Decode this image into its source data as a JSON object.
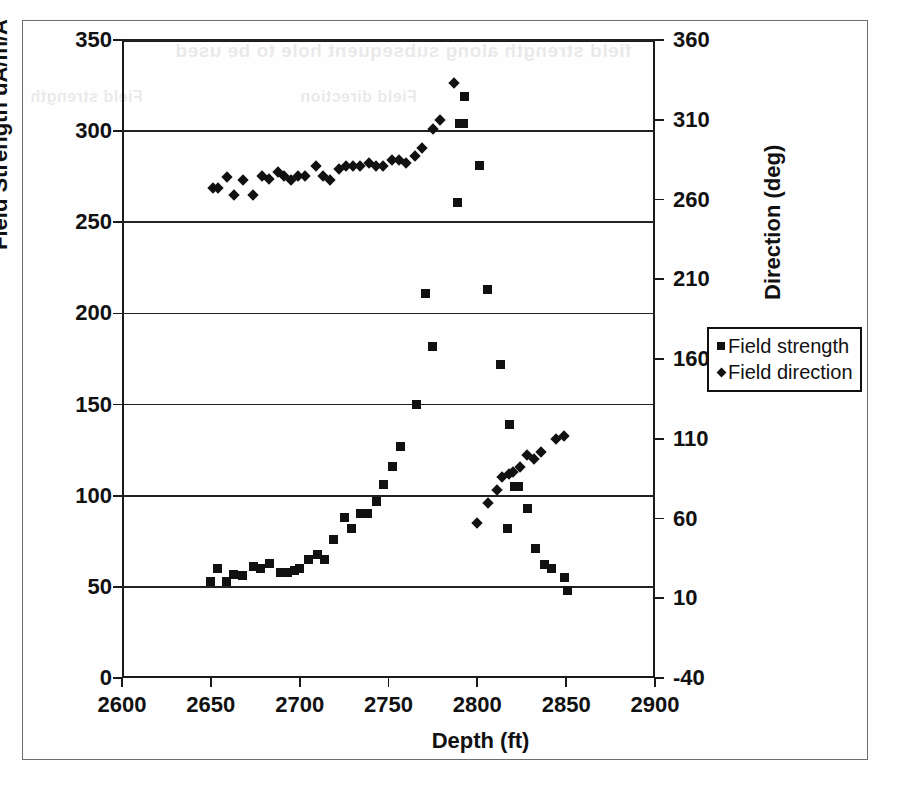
{
  "figure": {
    "frame_border_color": "#6e6e6e",
    "background": "#ffffff",
    "marker_color": "#111111",
    "ghost_text_1": "field strength along subsequent hole to be used",
    "ghost_text_2": "Field strength",
    "ghost_text_3": "Field direction"
  },
  "legend": {
    "position": "right-middle",
    "entries": [
      {
        "label": "Field strength",
        "marker": "square-marker-icon"
      },
      {
        "label": "Field direction",
        "marker": "diamond-marker-icon"
      }
    ]
  },
  "axes": {
    "left": {
      "title": "Field Strength uA/m/A",
      "ticks": [
        "0",
        "50",
        "100",
        "150",
        "200",
        "250",
        "300",
        "350"
      ]
    },
    "right": {
      "title": "Direction (deg)",
      "ticks": [
        "-40",
        "10",
        "60",
        "110",
        "160",
        "210",
        "260",
        "310",
        "360"
      ]
    },
    "bottom": {
      "title": "Depth (ft)",
      "ticks": [
        "2600",
        "2650",
        "2700",
        "2750",
        "2800",
        "2850",
        "2900"
      ]
    }
  },
  "chart_data": {
    "type": "scatter",
    "title": "",
    "xlabel": "Depth (ft)",
    "ylabel": "Field Strength uA/m/A",
    "y2label": "Direction (deg)",
    "xlim": [
      2600,
      2900
    ],
    "ylim": [
      0,
      350
    ],
    "y2lim": [
      -40,
      360
    ],
    "grid": true,
    "legend_position": "right",
    "series": [
      {
        "name": "Field strength",
        "marker": "square",
        "axis": "left",
        "units": "uA/m/A",
        "points": [
          [
            2650,
            53
          ],
          [
            2654,
            60
          ],
          [
            2659,
            53
          ],
          [
            2663,
            57
          ],
          [
            2668,
            56
          ],
          [
            2674,
            61
          ],
          [
            2678,
            60
          ],
          [
            2683,
            63
          ],
          [
            2689,
            58
          ],
          [
            2693,
            58
          ],
          [
            2697,
            59
          ],
          [
            2700,
            60
          ],
          [
            2705,
            65
          ],
          [
            2710,
            68
          ],
          [
            2714,
            65
          ],
          [
            2719,
            76
          ],
          [
            2725,
            88
          ],
          [
            2729,
            82
          ],
          [
            2734,
            90
          ],
          [
            2738,
            90
          ],
          [
            2743,
            97
          ],
          [
            2747,
            106
          ],
          [
            2752,
            116
          ],
          [
            2757,
            127
          ],
          [
            2766,
            150
          ],
          [
            2771,
            211
          ],
          [
            2775,
            182
          ],
          [
            2790,
            304
          ],
          [
            2792,
            304
          ],
          [
            2793,
            319
          ],
          [
            2789,
            261
          ],
          [
            2801,
            281
          ],
          [
            2806,
            213
          ],
          [
            2813,
            172
          ],
          [
            2818,
            139
          ],
          [
            2817,
            82
          ],
          [
            2821,
            105
          ],
          [
            2823,
            105
          ],
          [
            2828,
            93
          ],
          [
            2833,
            71
          ],
          [
            2838,
            62
          ],
          [
            2842,
            60
          ],
          [
            2849,
            55
          ],
          [
            2851,
            48
          ]
        ]
      },
      {
        "name": "Field direction",
        "marker": "diamond",
        "axis": "right",
        "units": "deg",
        "points": [
          [
            2651,
            267
          ],
          [
            2654,
            267
          ],
          [
            2659,
            274
          ],
          [
            2663,
            263
          ],
          [
            2668,
            272
          ],
          [
            2674,
            263
          ],
          [
            2679,
            275
          ],
          [
            2683,
            273
          ],
          [
            2688,
            277
          ],
          [
            2691,
            275
          ],
          [
            2695,
            272
          ],
          [
            2699,
            275
          ],
          [
            2703,
            275
          ],
          [
            2709,
            281
          ],
          [
            2713,
            275
          ],
          [
            2717,
            272
          ],
          [
            2722,
            279
          ],
          [
            2726,
            281
          ],
          [
            2730,
            281
          ],
          [
            2734,
            281
          ],
          [
            2739,
            283
          ],
          [
            2743,
            281
          ],
          [
            2747,
            281
          ],
          [
            2752,
            285
          ],
          [
            2756,
            285
          ],
          [
            2760,
            283
          ],
          [
            2765,
            287
          ],
          [
            2769,
            292
          ],
          [
            2775,
            304
          ],
          [
            2779,
            310
          ],
          [
            2787,
            333
          ],
          [
            2800,
            57
          ],
          [
            2806,
            70
          ],
          [
            2811,
            78
          ],
          [
            2814,
            86
          ],
          [
            2818,
            88
          ],
          [
            2820,
            89
          ],
          [
            2824,
            92
          ],
          [
            2828,
            100
          ],
          [
            2832,
            97
          ],
          [
            2836,
            102
          ],
          [
            2844,
            110
          ],
          [
            2849,
            112
          ]
        ]
      }
    ]
  }
}
